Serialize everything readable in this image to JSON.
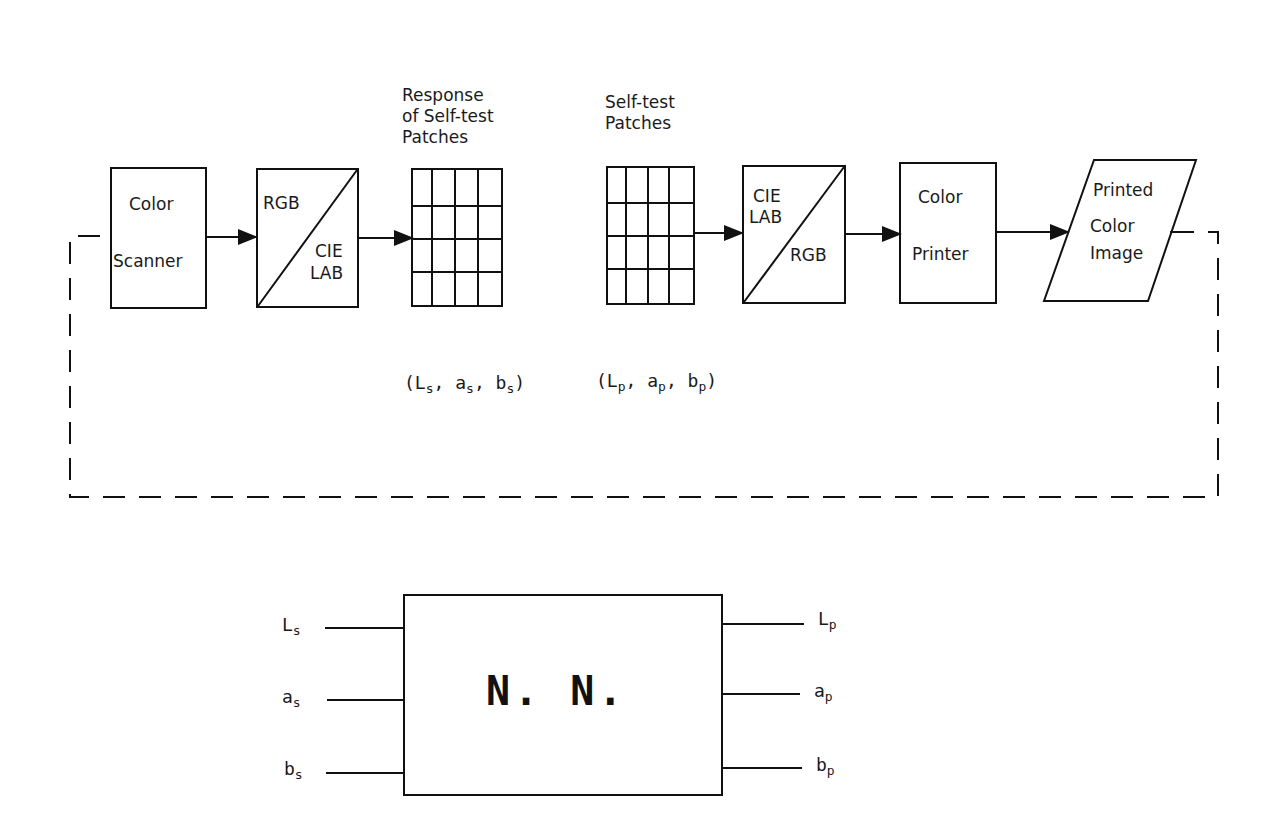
{
  "top_diagram": {
    "captions": {
      "response_patches": [
        "Response",
        "of Self-test",
        "Patches"
      ],
      "selftest_patches": [
        "Self-test",
        "Patches"
      ]
    },
    "blocks": {
      "color_scanner": [
        "Color",
        "Scanner"
      ],
      "rgb_to_lab": {
        "upper": "RGB",
        "lower": [
          "CIE",
          "LAB"
        ]
      },
      "lab_to_rgb": {
        "upper": [
          "CIE",
          "LAB"
        ],
        "lower": "RGB"
      },
      "color_printer": [
        "Color",
        "Printer"
      ],
      "printed_image": [
        "Printed",
        "Color",
        "Image"
      ]
    },
    "tuples": {
      "scanned": {
        "open": "(",
        "L": "L",
        "a": "a",
        "b": "b",
        "sub": "s",
        "sep": ",",
        "close": ")"
      },
      "printed": {
        "open": "(",
        "L": "L",
        "a": "a",
        "b": "b",
        "sub": "p",
        "sep": ",",
        "close": ")"
      }
    },
    "grid": {
      "rows": 4,
      "cols": 4
    }
  },
  "bottom_diagram": {
    "network_label": "N. N.",
    "inputs": [
      {
        "base": "L",
        "sub": "s"
      },
      {
        "base": "a",
        "sub": "s"
      },
      {
        "base": "b",
        "sub": "s"
      }
    ],
    "outputs": [
      {
        "base": "L",
        "sub": "p"
      },
      {
        "base": "a",
        "sub": "p"
      },
      {
        "base": "b",
        "sub": "p"
      }
    ]
  }
}
